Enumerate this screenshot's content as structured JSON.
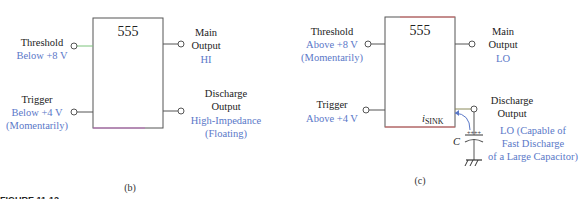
{
  "panels": [
    {
      "id": "b",
      "chip_label": "555",
      "caption": "(b)",
      "threshold": {
        "label": "Threshold",
        "state": [
          "Below +8 V"
        ]
      },
      "trigger": {
        "label": "Trigger",
        "state": [
          "Below +4 V",
          "(Momentarily)"
        ]
      },
      "main_output": {
        "label": [
          "Main",
          "Output"
        ],
        "state": "HI"
      },
      "discharge_output": {
        "label": [
          "Discharge",
          "Output"
        ],
        "state": [
          "High-Impedance",
          "(Floating)"
        ]
      }
    },
    {
      "id": "c",
      "chip_label": "555",
      "caption": "(c)",
      "threshold": {
        "label": "Threshold",
        "state": [
          "Above +8 V",
          "(Momentarily)"
        ]
      },
      "trigger": {
        "label": "Trigger",
        "state": [
          "Above +4 V"
        ]
      },
      "main_output": {
        "label": [
          "Main",
          "Output"
        ],
        "state": "LO"
      },
      "discharge_output": {
        "label": [
          "Discharge",
          "Output"
        ],
        "state": [
          "LO (Capable of",
          "Fast Discharge",
          "of a Large Capacitor)"
        ]
      },
      "sink_current": {
        "symbol": "i",
        "subscript": "SINK"
      },
      "capacitor": {
        "label": "C",
        "polarity": "++++"
      }
    }
  ],
  "figure_label": "FIGURE 11-12",
  "colors": {
    "state_text": "#5a78c8",
    "line": "#555555",
    "accent_green": "#7cc47c",
    "accent_red": "#e07070",
    "accent_magenta": "#d070d0"
  }
}
